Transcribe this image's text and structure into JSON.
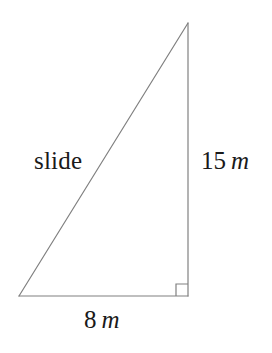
{
  "figure": {
    "background_color": "#ffffff",
    "stroke_color": "#808080",
    "text_color": "#1a1a1a",
    "stroke_width": 1.2,
    "width": 272,
    "height": 353
  },
  "triangle": {
    "vertices": {
      "bottom_left": {
        "x": 19,
        "y": 296
      },
      "bottom_right": {
        "x": 188,
        "y": 296
      },
      "apex": {
        "x": 188,
        "y": 23
      }
    },
    "right_angle_marker": {
      "corner_x": 188,
      "corner_y": 296,
      "size": 12,
      "name": "right-angle-square"
    }
  },
  "labels": {
    "hypotenuse": {
      "text": "slide",
      "name": "hypotenuse-label"
    },
    "vertical_leg": {
      "value": "15",
      "unit": "m",
      "name": "vertical-leg-label"
    },
    "horizontal_leg": {
      "value": "8",
      "unit": "m",
      "name": "horizontal-leg-label"
    }
  }
}
